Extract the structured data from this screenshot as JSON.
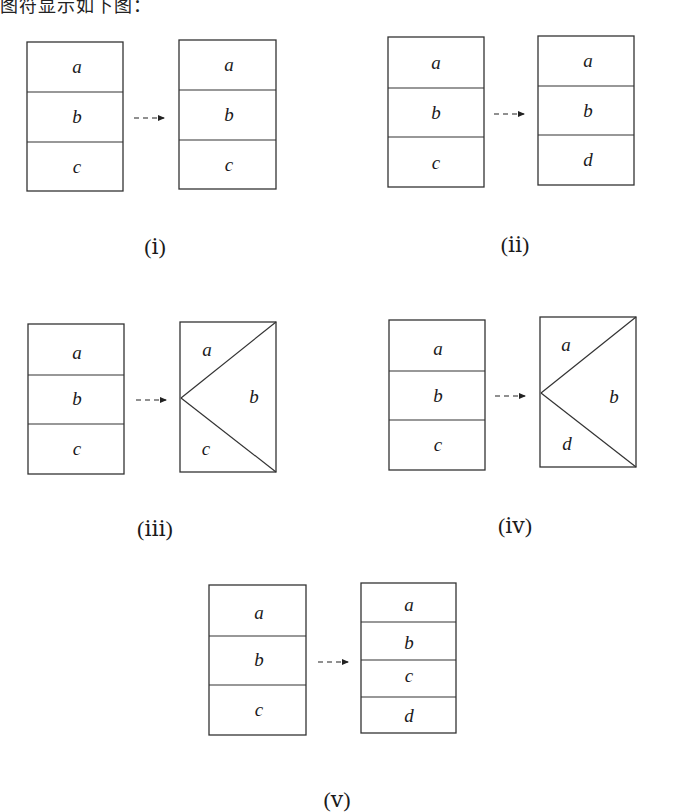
{
  "heading_fragment": "图符显示如下图：",
  "diagrams": [
    {
      "caption": "(ⅰ)",
      "before": [
        "a",
        "b",
        "c"
      ],
      "after_layout": "stack",
      "after": [
        "a",
        "b",
        "c"
      ]
    },
    {
      "caption": "(ⅱ)",
      "before": [
        "a",
        "b",
        "c"
      ],
      "after_layout": "stack",
      "after": [
        "a",
        "b",
        "d"
      ]
    },
    {
      "caption": "(ⅲ)",
      "before": [
        "a",
        "b",
        "c"
      ],
      "after_layout": "wedge",
      "after": [
        "a",
        "b",
        "c"
      ]
    },
    {
      "caption": "(ⅳ)",
      "before": [
        "a",
        "b",
        "c"
      ],
      "after_layout": "wedge",
      "after": [
        "a",
        "b",
        "d"
      ]
    },
    {
      "caption": "(ⅴ)",
      "before": [
        "a",
        "b",
        "c"
      ],
      "after_layout": "stack",
      "after": [
        "a",
        "b",
        "c",
        "d"
      ]
    }
  ],
  "colors": {
    "stroke": "#333333",
    "text": "#1a1a1a",
    "background": "#ffffff"
  }
}
